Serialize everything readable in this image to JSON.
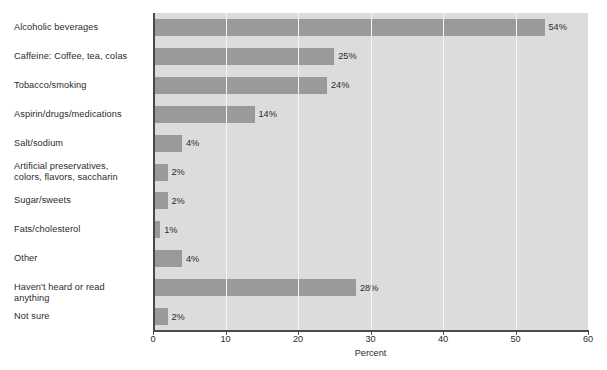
{
  "chart_data": {
    "type": "bar",
    "orientation": "horizontal",
    "title": "",
    "xlabel": "Percent",
    "ylabel": "",
    "xlim": [
      0,
      60
    ],
    "xticks": [
      0,
      10,
      20,
      30,
      40,
      50,
      60
    ],
    "xtick_labels": [
      "0",
      "10",
      "20",
      "30",
      "40",
      "50",
      "60"
    ],
    "grid": "vertical",
    "legend": "none",
    "categories": [
      "Alcoholic beverages",
      "Caffeine: Coffee, tea, colas",
      "Tobacco/smoking",
      "Aspirin/drugs/medications",
      "Salt/sodium",
      "Artificial preservatives,\ncolors, flavors, saccharin",
      "Sugar/sweets",
      "Fats/cholesterol",
      "Other",
      "Haven't heard or read anything",
      "Not sure"
    ],
    "values": [
      54,
      25,
      24,
      14,
      4,
      2,
      2,
      1,
      4,
      28,
      2
    ],
    "data_labels": [
      "54%",
      "25%",
      "24%",
      "14%",
      "4%",
      "2%",
      "2%",
      "1%",
      "4%",
      "28%",
      "2%"
    ],
    "colors": {
      "bar": "#9a9a9a",
      "plot_background": "#dcdcdc",
      "gridline": "#f4f4f4",
      "axis": "#4a4a4a",
      "text": "#2b2b2b",
      "page_background": "#ffffff"
    }
  }
}
